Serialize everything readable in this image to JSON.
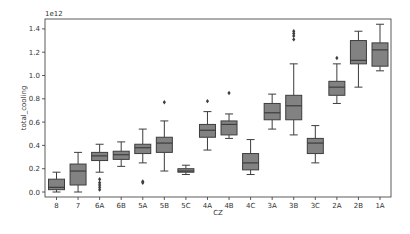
{
  "chart_data": {
    "type": "boxplot",
    "title": "",
    "xlabel": "CZ",
    "ylabel": "total_cooling",
    "y_offset_text": "1e12",
    "ylim": [
      -0.05,
      1.48
    ],
    "yticks": [
      0.0,
      0.2,
      0.4,
      0.6,
      0.8,
      1.0,
      1.2,
      1.4
    ],
    "ytick_labels": [
      "0.0",
      "0.2",
      "0.4",
      "0.6",
      "0.8",
      "1.0",
      "1.2",
      "1.4"
    ],
    "grid": false,
    "legend": null,
    "categories": [
      "8",
      "7",
      "6A",
      "6B",
      "5A",
      "5B",
      "5C",
      "4A",
      "4B",
      "4C",
      "3A",
      "3B",
      "3C",
      "2A",
      "2B",
      "1A"
    ],
    "boxes": [
      {
        "category": "8",
        "whisker_low": 0.0,
        "q1": 0.02,
        "median": 0.04,
        "q3": 0.11,
        "whisker_high": 0.17,
        "outliers": []
      },
      {
        "category": "7",
        "whisker_low": 0.0,
        "q1": 0.06,
        "median": 0.18,
        "q3": 0.24,
        "whisker_high": 0.34,
        "outliers": []
      },
      {
        "category": "6A",
        "whisker_low": 0.17,
        "q1": 0.27,
        "median": 0.31,
        "q3": 0.34,
        "whisker_high": 0.41,
        "outliers": [
          0.11,
          0.08,
          0.06,
          0.04,
          0.02
        ]
      },
      {
        "category": "6B",
        "whisker_low": 0.22,
        "q1": 0.28,
        "median": 0.32,
        "q3": 0.35,
        "whisker_high": 0.43,
        "outliers": []
      },
      {
        "category": "5A",
        "whisker_low": 0.25,
        "q1": 0.33,
        "median": 0.38,
        "q3": 0.41,
        "whisker_high": 0.54,
        "outliers": [
          0.09,
          0.08
        ]
      },
      {
        "category": "5B",
        "whisker_low": 0.18,
        "q1": 0.34,
        "median": 0.42,
        "q3": 0.47,
        "whisker_high": 0.61,
        "outliers": [
          0.77
        ]
      },
      {
        "category": "5C",
        "whisker_low": 0.15,
        "q1": 0.17,
        "median": 0.18,
        "q3": 0.2,
        "whisker_high": 0.23,
        "outliers": []
      },
      {
        "category": "4A",
        "whisker_low": 0.36,
        "q1": 0.47,
        "median": 0.53,
        "q3": 0.58,
        "whisker_high": 0.69,
        "outliers": [
          0.78
        ]
      },
      {
        "category": "4B",
        "whisker_low": 0.46,
        "q1": 0.49,
        "median": 0.58,
        "q3": 0.61,
        "whisker_high": 0.67,
        "outliers": [
          0.85
        ]
      },
      {
        "category": "4C",
        "whisker_low": 0.15,
        "q1": 0.19,
        "median": 0.25,
        "q3": 0.33,
        "whisker_high": 0.45,
        "outliers": []
      },
      {
        "category": "3A",
        "whisker_low": 0.54,
        "q1": 0.62,
        "median": 0.68,
        "q3": 0.76,
        "whisker_high": 0.84,
        "outliers": []
      },
      {
        "category": "3B",
        "whisker_low": 0.49,
        "q1": 0.62,
        "median": 0.74,
        "q3": 0.83,
        "whisker_high": 1.1,
        "outliers": [
          1.31,
          1.34,
          1.36,
          1.38
        ]
      },
      {
        "category": "3C",
        "whisker_low": 0.25,
        "q1": 0.33,
        "median": 0.42,
        "q3": 0.46,
        "whisker_high": 0.57,
        "outliers": []
      },
      {
        "category": "2A",
        "whisker_low": 0.76,
        "q1": 0.83,
        "median": 0.9,
        "q3": 0.95,
        "whisker_high": 1.1,
        "outliers": [
          1.15
        ]
      },
      {
        "category": "2B",
        "whisker_low": 0.9,
        "q1": 1.1,
        "median": 1.13,
        "q3": 1.3,
        "whisker_high": 1.38,
        "outliers": []
      },
      {
        "category": "1A",
        "whisker_low": 1.04,
        "q1": 1.08,
        "median": 1.22,
        "q3": 1.28,
        "whisker_high": 1.44,
        "outliers": []
      }
    ],
    "colors": {
      "box_fill": "#828282",
      "line": "#3d3d3d",
      "axis": "#333333",
      "text": "#333333"
    }
  }
}
